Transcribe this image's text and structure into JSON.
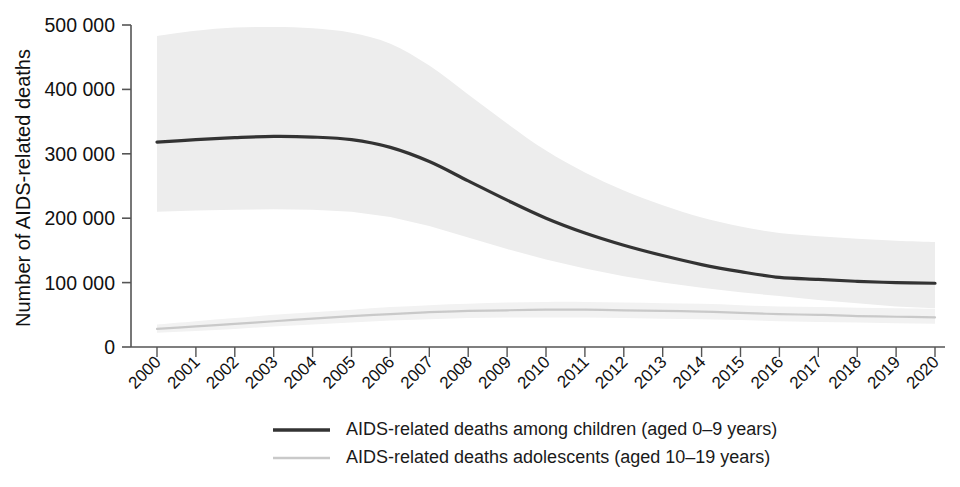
{
  "chart_data": {
    "type": "line",
    "title": "",
    "xlabel": "",
    "ylabel": "Number of  AIDS-related deaths",
    "ylim": [
      0,
      500000
    ],
    "xlim": [
      2000,
      2020
    ],
    "grid": false,
    "legend_position": "bottom-center",
    "ytick_labels": [
      "0",
      "100 000",
      "200 000",
      "300 000",
      "400 000",
      "500 000"
    ],
    "ytick_values": [
      0,
      100000,
      200000,
      300000,
      400000,
      500000
    ],
    "categories": [
      "2000",
      "2001",
      "2002",
      "2003",
      "2004",
      "2005",
      "2006",
      "2007",
      "2008",
      "2009",
      "2010",
      "2011",
      "2012",
      "2013",
      "2014",
      "2015",
      "2016",
      "2017",
      "2018",
      "2019",
      "2020"
    ],
    "x": [
      2000,
      2001,
      2002,
      2003,
      2004,
      2005,
      2006,
      2007,
      2008,
      2009,
      2010,
      2011,
      2012,
      2013,
      2014,
      2015,
      2016,
      2017,
      2018,
      2019,
      2020
    ],
    "series": [
      {
        "name": "AIDS-related deaths among children (aged 0–9 years)",
        "style": "solid-dark",
        "color": "#333333",
        "values": [
          318000,
          322000,
          325000,
          327000,
          326000,
          322000,
          310000,
          288000,
          258000,
          228000,
          200000,
          177000,
          158000,
          142000,
          128000,
          117000,
          108000,
          105000,
          102000,
          100000,
          99000
        ],
        "band_lower": [
          210000,
          212000,
          213000,
          214000,
          213000,
          210000,
          202000,
          188000,
          170000,
          152000,
          136000,
          122000,
          110000,
          100000,
          92000,
          85000,
          79000,
          73000,
          68000,
          63000,
          60000
        ],
        "band_upper": [
          483000,
          491000,
          496000,
          497000,
          495000,
          488000,
          471000,
          437000,
          392000,
          347000,
          305000,
          271000,
          243000,
          220000,
          201000,
          187000,
          177000,
          172000,
          168000,
          165000,
          163000
        ]
      },
      {
        "name": "AIDS-related deaths adolescents (aged 10–19 years)",
        "style": "solid-light",
        "color": "#c9c9c9",
        "values": [
          28000,
          32000,
          36000,
          40000,
          44000,
          48000,
          51000,
          54000,
          56000,
          57000,
          58000,
          58000,
          57000,
          56000,
          55000,
          53000,
          51000,
          50000,
          48000,
          47000,
          46000
        ],
        "band_lower": [
          22000,
          25000,
          28000,
          32000,
          35000,
          38000,
          41000,
          43000,
          45000,
          46000,
          46000,
          46000,
          45000,
          44000,
          43000,
          42000,
          40000,
          39000,
          38000,
          37000,
          36000
        ],
        "band_upper": [
          35000,
          40000,
          45000,
          50000,
          54000,
          58000,
          62000,
          65000,
          67000,
          69000,
          70000,
          70000,
          69000,
          68000,
          67000,
          65000,
          63000,
          62000,
          61000,
          60000,
          59000
        ]
      }
    ],
    "legend": [
      {
        "label": "AIDS-related deaths among children (aged 0–9 years)",
        "swatch": "solid-dark",
        "color": "#333333"
      },
      {
        "label": "AIDS-related deaths adolescents (aged 10–19 years)",
        "swatch": "solid-light",
        "color": "#c9c9c9"
      }
    ],
    "colors": {
      "axis": "#555555",
      "band_fill": "#ededed",
      "band_fill_secondary": "#f2f2f2",
      "text": "#111111",
      "background": "#ffffff"
    }
  }
}
